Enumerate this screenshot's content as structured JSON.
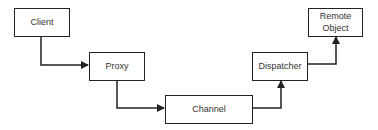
{
  "diagram": {
    "nodes": [
      {
        "id": "client",
        "label": "Client"
      },
      {
        "id": "proxy",
        "label": "Proxy"
      },
      {
        "id": "channel",
        "label": "Channel"
      },
      {
        "id": "dispatcher",
        "label": "Dispatcher"
      },
      {
        "id": "remote",
        "label_line1": "Remote",
        "label_line2": "Object"
      }
    ],
    "edges": [
      {
        "from": "client",
        "to": "proxy"
      },
      {
        "from": "proxy",
        "to": "channel"
      },
      {
        "from": "channel",
        "to": "dispatcher"
      },
      {
        "from": "dispatcher",
        "to": "remote"
      }
    ],
    "colors": {
      "line": "#222222",
      "text": "#333333",
      "background": "#ffffff"
    }
  }
}
